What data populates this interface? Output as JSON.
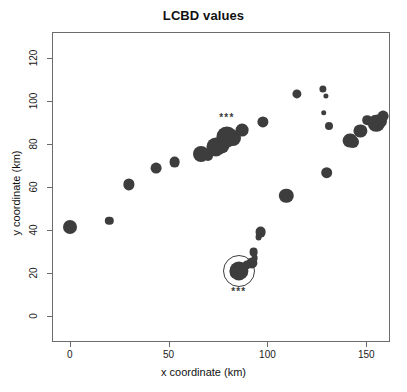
{
  "chart_data": {
    "type": "scatter",
    "title": "LCBD values",
    "xlabel": "x coordinate (km)",
    "ylabel": "y coordinate (km)",
    "xlim": [
      -9,
      162
    ],
    "ylim": [
      -12,
      132
    ],
    "xticks": [
      0,
      50,
      100,
      150
    ],
    "yticks": [
      0,
      20,
      40,
      60,
      80,
      100,
      120
    ],
    "xticklabels": [
      "0",
      "50",
      "100",
      "150"
    ],
    "yticklabels": [
      "0",
      "20",
      "40",
      "60",
      "80",
      "100",
      "120"
    ],
    "grid": false,
    "legend": null,
    "marker_color": "#3d3d3d",
    "frame_color": "#6b6b6b",
    "size_encodes": "LCBD value (bubble area proportional to LCBD)",
    "points": [
      {
        "x": 0,
        "y": 41.6,
        "size": 7.0
      },
      {
        "x": 20,
        "y": 44.2,
        "size": 4.2
      },
      {
        "x": 30,
        "y": 61.2,
        "size": 5.6
      },
      {
        "x": 43.5,
        "y": 68.6,
        "size": 5.4
      },
      {
        "x": 53,
        "y": 71.6,
        "size": 5.4
      },
      {
        "x": 66.5,
        "y": 75.2,
        "size": 8.0
      },
      {
        "x": 70,
        "y": 74.6,
        "size": 5.0
      },
      {
        "x": 74,
        "y": 78.8,
        "size": 9.6
      },
      {
        "x": 76.5,
        "y": 79.6,
        "size": 8.4
      },
      {
        "x": 79.5,
        "y": 83.2,
        "size": 10.6
      },
      {
        "x": 82.5,
        "y": 82.6,
        "size": 8.0
      },
      {
        "x": 87,
        "y": 86.4,
        "size": 6.4
      },
      {
        "x": 97.5,
        "y": 90.4,
        "size": 5.6
      },
      {
        "x": 109.5,
        "y": 56.0,
        "size": 7.2
      },
      {
        "x": 115,
        "y": 103.2,
        "size": 4.6
      },
      {
        "x": 128,
        "y": 105.4,
        "size": 3.6
      },
      {
        "x": 129.5,
        "y": 102.4,
        "size": 2.6
      },
      {
        "x": 128.5,
        "y": 94.6,
        "size": 2.8
      },
      {
        "x": 131,
        "y": 88.4,
        "size": 4.0
      },
      {
        "x": 130,
        "y": 66.6,
        "size": 5.8
      },
      {
        "x": 142,
        "y": 81.6,
        "size": 7.4
      },
      {
        "x": 143.5,
        "y": 81.0,
        "size": 6.0
      },
      {
        "x": 147,
        "y": 86.0,
        "size": 6.6
      },
      {
        "x": 150.5,
        "y": 91.0,
        "size": 4.8
      },
      {
        "x": 155,
        "y": 89.6,
        "size": 8.2
      },
      {
        "x": 157,
        "y": 90.6,
        "size": 7.0
      },
      {
        "x": 158.5,
        "y": 92.8,
        "size": 5.4
      },
      {
        "x": 96.5,
        "y": 39.2,
        "size": 5.4
      },
      {
        "x": 95.5,
        "y": 36.8,
        "size": 3.4
      },
      {
        "x": 93,
        "y": 29.8,
        "size": 4.4
      },
      {
        "x": 93.5,
        "y": 27.0,
        "size": 3.4
      },
      {
        "x": 92,
        "y": 24.6,
        "size": 5.6
      },
      {
        "x": 89.5,
        "y": 23.8,
        "size": 4.6
      },
      {
        "x": 85.5,
        "y": 21.0,
        "size": 9.6
      },
      {
        "x": 84,
        "y": 20.4,
        "size": 6.2
      }
    ],
    "highlighted_points": [
      {
        "x": 85.5,
        "y": 21.0,
        "ring_size": 15.0
      }
    ],
    "annotations": [
      {
        "text": "***",
        "x": 79.5,
        "y": 92.0
      },
      {
        "text": "***",
        "x": 85.5,
        "y": 11.0
      }
    ]
  }
}
